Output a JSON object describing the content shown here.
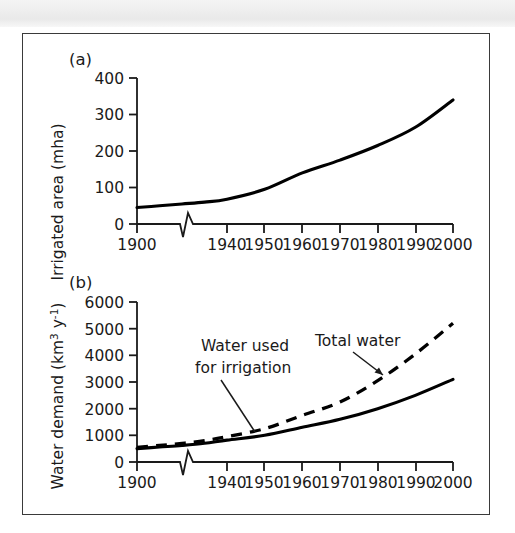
{
  "figure": {
    "background_color": "#ffffff",
    "frame_color": "#3a3a3a",
    "line_color": "#000000",
    "top_band_color": "#eeeeee"
  },
  "panel_a": {
    "label": "(a)",
    "ylabel": "Irrigated area (mha)",
    "y_ticks": [
      "0",
      "100",
      "200",
      "300",
      "400"
    ],
    "x_ticks": [
      "1900",
      "1940",
      "1950",
      "1960",
      "1970",
      "1980",
      "1990",
      "2000"
    ],
    "axis_break": "zigzag"
  },
  "panel_b": {
    "label": "(b)",
    "ylabel_main": "Water demand (km",
    "ylabel_sup1": "3",
    "ylabel_mid": " y",
    "ylabel_sup2": "-1",
    "ylabel_end": ")",
    "y_ticks": [
      "0",
      "1000",
      "2000",
      "3000",
      "4000",
      "5000",
      "6000"
    ],
    "x_ticks": [
      "1900",
      "1940",
      "1950",
      "1960",
      "1970",
      "1980",
      "1990",
      "2000"
    ],
    "annotation_total": "Total water",
    "annotation_irrigation_line1": "Water used",
    "annotation_irrigation_line2": "for irrigation",
    "axis_break": "zigzag"
  },
  "chart_data": [
    {
      "type": "line",
      "title": "(a)",
      "xlabel": "",
      "ylabel": "Irrigated area (mha)",
      "xlim": [
        1900,
        2000
      ],
      "ylim": [
        0,
        400
      ],
      "grid": false,
      "axis_break_after": 1900,
      "x": [
        1900,
        1910,
        1920,
        1930,
        1940,
        1950,
        1960,
        1970,
        1980,
        1990,
        2000
      ],
      "series": [
        {
          "name": "Irrigated area",
          "style": "solid",
          "values": [
            45,
            50,
            55,
            60,
            68,
            95,
            140,
            175,
            215,
            265,
            340
          ]
        }
      ],
      "x_tick_labels": [
        "1900",
        "1940",
        "1950",
        "1960",
        "1970",
        "1980",
        "1990",
        "2000"
      ],
      "y_tick_labels": [
        "0",
        "100",
        "200",
        "300",
        "400"
      ]
    },
    {
      "type": "line",
      "title": "(b)",
      "xlabel": "",
      "ylabel": "Water demand (km3 y-1)",
      "xlim": [
        1900,
        2000
      ],
      "ylim": [
        0,
        6000
      ],
      "grid": false,
      "axis_break_after": 1900,
      "x": [
        1900,
        1910,
        1920,
        1930,
        1940,
        1950,
        1960,
        1970,
        1980,
        1990,
        2000
      ],
      "series": [
        {
          "name": "Total water",
          "style": "dashed",
          "values": [
            550,
            620,
            700,
            800,
            950,
            1250,
            1750,
            2250,
            3050,
            4050,
            5200
          ]
        },
        {
          "name": "Water used for irrigation",
          "style": "solid",
          "values": [
            500,
            560,
            620,
            700,
            820,
            1000,
            1300,
            1600,
            2000,
            2500,
            3100
          ]
        }
      ],
      "x_tick_labels": [
        "1900",
        "1940",
        "1950",
        "1960",
        "1970",
        "1980",
        "1990",
        "2000"
      ],
      "y_tick_labels": [
        "0",
        "1000",
        "2000",
        "3000",
        "4000",
        "5000",
        "6000"
      ],
      "annotations": [
        "Total water",
        "Water used for irrigation"
      ],
      "legend": "inline-annotations"
    }
  ]
}
